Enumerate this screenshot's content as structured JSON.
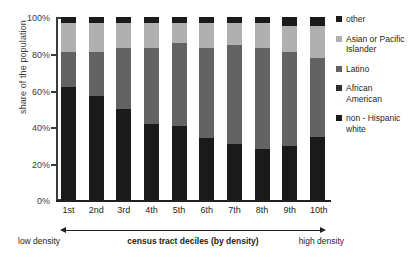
{
  "chart_data": {
    "type": "bar",
    "subtype": "stacked-100-percent",
    "title": "",
    "xlabel": "census tract deciles (by density)",
    "ylabel": "share of the population",
    "ylim": [
      0,
      100
    ],
    "yticks": [
      "0%",
      "20%",
      "40%",
      "60%",
      "80%",
      "100%"
    ],
    "grid": false,
    "legend_position": "right",
    "categories": [
      "1st",
      "2nd",
      "3rd",
      "4th",
      "5th",
      "6th",
      "7th",
      "8th",
      "9th",
      "10th"
    ],
    "stack_order_bottom_to_top": [
      "non-Hispanic white",
      "African American",
      "Latino",
      "Asian or Pacific Islander",
      "other"
    ],
    "series": [
      {
        "name": "non-Hispanic white",
        "color": "#1a1a1a",
        "values": [
          62,
          57,
          50,
          42,
          41,
          34,
          31,
          28,
          30,
          35
        ]
      },
      {
        "name": "African American",
        "color": "#2e2e2e",
        "values": [
          0,
          0,
          0,
          0,
          0,
          0,
          0,
          0,
          0,
          0
        ]
      },
      {
        "name": "Latino",
        "color": "#636363",
        "values": [
          19,
          24,
          33,
          41,
          45,
          49,
          54,
          55,
          51,
          43
        ]
      },
      {
        "name": "Asian or Pacific Islander",
        "color": "#b0b0b0",
        "values": [
          16,
          16,
          14,
          14,
          11,
          14,
          12,
          14,
          14,
          17
        ]
      },
      {
        "name": "other",
        "color": "#1a1a1a",
        "values": [
          3,
          3,
          3,
          3,
          3,
          3,
          3,
          3,
          5,
          5
        ]
      }
    ],
    "annotations": {
      "low_density": "low density",
      "high_density": "high density"
    }
  },
  "axis": {
    "y_title": "share of the population",
    "y_ticks": [
      {
        "label": "100%",
        "value": 100
      },
      {
        "label": "80%",
        "value": 80
      },
      {
        "label": "60%",
        "value": 60
      },
      {
        "label": "40%",
        "value": 40
      },
      {
        "label": "20%",
        "value": 20
      },
      {
        "label": "0%",
        "value": 0
      }
    ],
    "x_title": "census tract deciles (by density)",
    "x_labels": [
      "1st",
      "2nd",
      "3rd",
      "4th",
      "5th",
      "6th",
      "7th",
      "8th",
      "9th",
      "10th"
    ],
    "low_label": "low density",
    "high_label": "high density"
  },
  "legend": {
    "items": [
      {
        "label": "other",
        "color": "#1a1a1a"
      },
      {
        "label": "Asian or Pacific Islander",
        "color": "#b0b0b0"
      },
      {
        "label": "Latino",
        "color": "#636363"
      },
      {
        "label": "African American",
        "color": "#2e2e2e"
      },
      {
        "label": "non - Hispanic white",
        "color": "#1a1a1a"
      }
    ]
  },
  "colors": {
    "axis": "#3b3b3b",
    "text": "#231f20",
    "background": "#ffffff"
  }
}
